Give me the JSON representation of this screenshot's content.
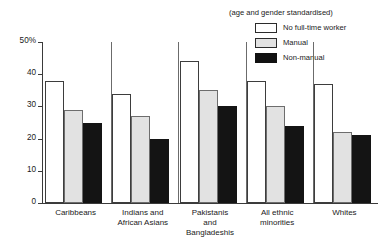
{
  "chart_data": {
    "type": "bar",
    "title": "",
    "subtitle": "",
    "annotation": "(age and gender standardised)",
    "xlabel": "",
    "ylabel": "",
    "ylim": [
      0,
      50
    ],
    "yticks": [
      {
        "value": 50,
        "label": "50%"
      },
      {
        "value": 40,
        "label": "40"
      },
      {
        "value": 30,
        "label": "30"
      },
      {
        "value": 20,
        "label": "20"
      },
      {
        "value": 10,
        "label": "10"
      },
      {
        "value": 0,
        "label": "0"
      }
    ],
    "grid": false,
    "legend_position": "top-right",
    "categories": [
      "Caribbeans",
      "Indians and African Asians",
      "Pakistanis and Bangladeshis",
      "All ethnic minorities",
      "Whites"
    ],
    "category_lines": [
      [
        "Caribbeans"
      ],
      [
        "Indians and",
        "African Asians"
      ],
      [
        "Pakistanis",
        "and",
        "Bangladeshis"
      ],
      [
        "All ethnic",
        "minorities"
      ],
      [
        "Whites"
      ]
    ],
    "series": [
      {
        "name": "No full-time worker",
        "fill": "#ffffff",
        "values": [
          38,
          34,
          44,
          38,
          37
        ]
      },
      {
        "name": "Manual",
        "fill": "#e2e2e2",
        "values": [
          29,
          27,
          35,
          30,
          22
        ]
      },
      {
        "name": "Non-manual",
        "fill": "#141414",
        "values": [
          25,
          20,
          30,
          24,
          21
        ]
      }
    ]
  },
  "legend": {
    "note": "(age and gender standardised)",
    "entries": [
      {
        "label": "No full-time worker",
        "swatch": "sw-white"
      },
      {
        "label": "Manual",
        "swatch": "sw-gray"
      },
      {
        "label": "Non-manual",
        "swatch": "sw-black"
      }
    ]
  }
}
